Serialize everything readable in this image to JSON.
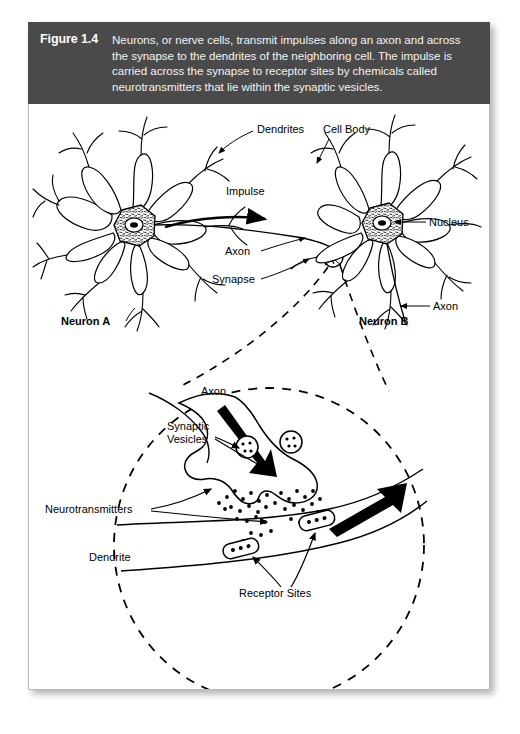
{
  "figure": {
    "number": "Figure 1.4",
    "caption": "Neurons, or nerve cells, transmit impulses along an axon and across the synapse to the dendrites of the neighboring cell. The impulse is carried across the synapse to receptor sites by chemicals called neurotransmitters that lie within the synaptic vesicles.",
    "banner_color": "#4a4a4a",
    "banner_text_color": "#ffffff",
    "card_background": "#ffffff",
    "ink_color": "#000000"
  },
  "overview_diagram": {
    "labels": {
      "dendrites": "Dendrites",
      "cell_body": "Cell Body",
      "impulse": "Impulse",
      "nucleus": "Nucleus",
      "axon_left": "Axon",
      "axon_right": "Axon",
      "synapse": "Synapse",
      "neuron_a": "Neuron A",
      "neuron_b": "Neuron B"
    }
  },
  "detail_diagram": {
    "labels": {
      "axon": "Axon",
      "synaptic_vesicles": "Synaptic\nVesicles",
      "synaptic_vesicles_line1": "Synaptic",
      "synaptic_vesicles_line2": "Vesicles",
      "neurotransmitters": "Neurotransmitters",
      "dendrite": "Dendrite",
      "receptor_sites": "Receptor Sites"
    }
  }
}
